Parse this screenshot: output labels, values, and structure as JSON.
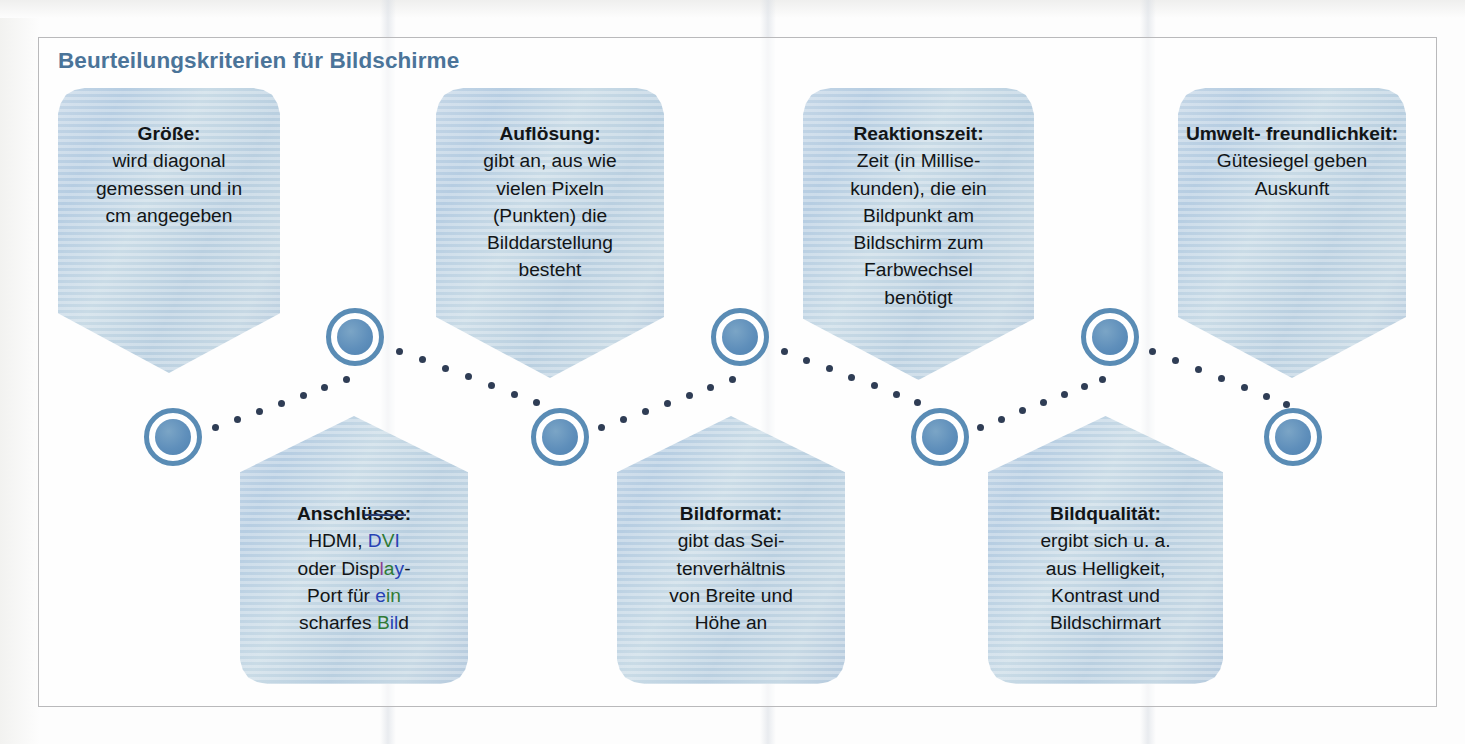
{
  "heading": "Beurteilungskriterien für Bildschirme",
  "colors": {
    "heading": "#4b7499",
    "card_fill": "#bed3e3",
    "node_ring": "#5a8cb5",
    "node_core": "#5f8fbb",
    "dot": "#2f3d55",
    "frame_border": "#b9b9bb"
  },
  "cards": [
    {
      "id": "groesse",
      "direction": "down",
      "title": "Größe:",
      "lines": [
        "wird diagonal",
        "gemessen und in",
        "cm angegeben"
      ]
    },
    {
      "id": "aufloesung",
      "direction": "down",
      "title": "Auflösung:",
      "lines": [
        "gibt an, aus wie",
        "vielen Pixeln",
        "(Punkten) die",
        "Bilddarstellung",
        "besteht"
      ]
    },
    {
      "id": "reaktionszeit",
      "direction": "down",
      "title": "Reaktionszeit:",
      "lines": [
        "Zeit (in Millise-",
        "kunden), die ein",
        "Bildpunkt am",
        "Bildschirm zum",
        "Farbwechsel",
        "benötigt"
      ]
    },
    {
      "id": "umweltfreundlichkeit",
      "direction": "down",
      "title": "Umwelt-\nfreundlichkeit:",
      "title_lines": [
        "Umwelt-",
        "freundlichkeit:"
      ],
      "lines": [
        "Gütesiegel geben",
        "Auskunft"
      ]
    },
    {
      "id": "anschluesse",
      "direction": "up",
      "title": "Anschlüsse:",
      "lines": [
        "HDMI, DVI",
        "oder Display-",
        "Port für ein",
        "scharfes Bild"
      ]
    },
    {
      "id": "bildformat",
      "direction": "up",
      "title": "Bildformat:",
      "lines": [
        "gibt das Sei-",
        "tenverhältnis",
        "von Breite und",
        "Höhe an"
      ]
    },
    {
      "id": "bildqualitaet",
      "direction": "up",
      "title": "Bildqualität:",
      "lines": [
        "ergibt sich u. a.",
        "aus Helligkeit,",
        "Kontrast und",
        "Bildschirmart"
      ]
    }
  ],
  "nodes": [
    {
      "id": "node-1",
      "row": "lower"
    },
    {
      "id": "node-2",
      "row": "upper"
    },
    {
      "id": "node-3",
      "row": "lower"
    },
    {
      "id": "node-4",
      "row": "upper"
    },
    {
      "id": "node-5",
      "row": "lower"
    },
    {
      "id": "node-6",
      "row": "upper"
    },
    {
      "id": "node-7",
      "row": "lower"
    }
  ]
}
